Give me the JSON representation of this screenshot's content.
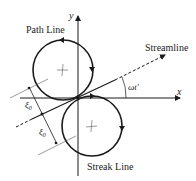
{
  "diagram": {
    "labels": {
      "path_line": "Path Line",
      "streamline": "Streamline",
      "streak_line": "Streak Line",
      "x_axis": "x",
      "y_axis": "y",
      "angle": "ωt′",
      "xi_upper": "ξ",
      "xi_upper_sub": "0",
      "xi_lower": "ξ",
      "xi_lower_sub": "0"
    },
    "colors": {
      "line": "#1a1a1a",
      "thin": "#555555",
      "background": "#ffffff"
    }
  }
}
